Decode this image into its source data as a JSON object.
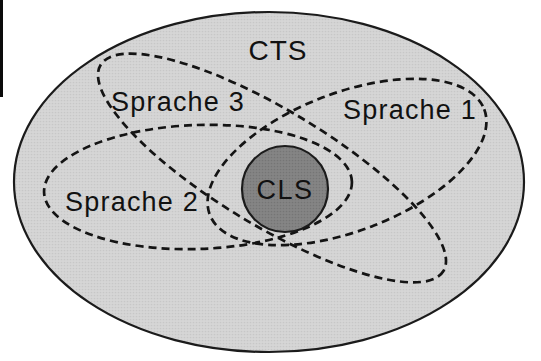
{
  "figure": {
    "type": "euler-diagram",
    "labels": {
      "outer": "CTS",
      "center": "CLS",
      "sprache1": "Sprache 1",
      "sprache2": "Sprache 2",
      "sprache3": "Sprache 3"
    },
    "colors": {
      "paper": "#ffffff",
      "outer_fill": "#d6d6d6",
      "outer_stroke": "#1b1b1b",
      "dashed_stroke": "#141414",
      "cls_fill": "#858585",
      "cls_stroke": "#1b1b1b",
      "label_color": "#111111",
      "cls_label_color": "#f4f4f4",
      "scan_artifact": "#0a0a0a"
    }
  }
}
